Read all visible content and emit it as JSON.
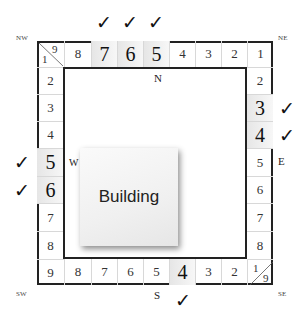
{
  "diagram": {
    "building_label": "Building",
    "corner_labels": {
      "nw": "NW",
      "ne": "NE",
      "sw": "SW",
      "se": "SE"
    },
    "direction_labels": {
      "n": "N",
      "e": "E",
      "s": "S",
      "w": "W"
    },
    "top_row": {
      "corner_nw": {
        "top": "9",
        "bottom": "1"
      },
      "cells": [
        "8",
        "7",
        "6",
        "5",
        "4",
        "3",
        "2",
        "1"
      ]
    },
    "right_col": [
      "2",
      "3",
      "4",
      "5",
      "6",
      "7",
      "8"
    ],
    "bottom_row": {
      "cells": [
        "9",
        "8",
        "7",
        "6",
        "5",
        "4",
        "3",
        "2"
      ],
      "corner_se": {
        "top": "1",
        "bottom": "9"
      }
    },
    "left_col": [
      "2",
      "3",
      "4",
      "5",
      "6",
      "7",
      "8"
    ],
    "checked": {
      "top": [
        "7",
        "6",
        "5"
      ],
      "right": [
        "3",
        "4"
      ],
      "bottom": [
        "4"
      ],
      "left": [
        "5",
        "6"
      ]
    },
    "check_glyph": "✓"
  }
}
